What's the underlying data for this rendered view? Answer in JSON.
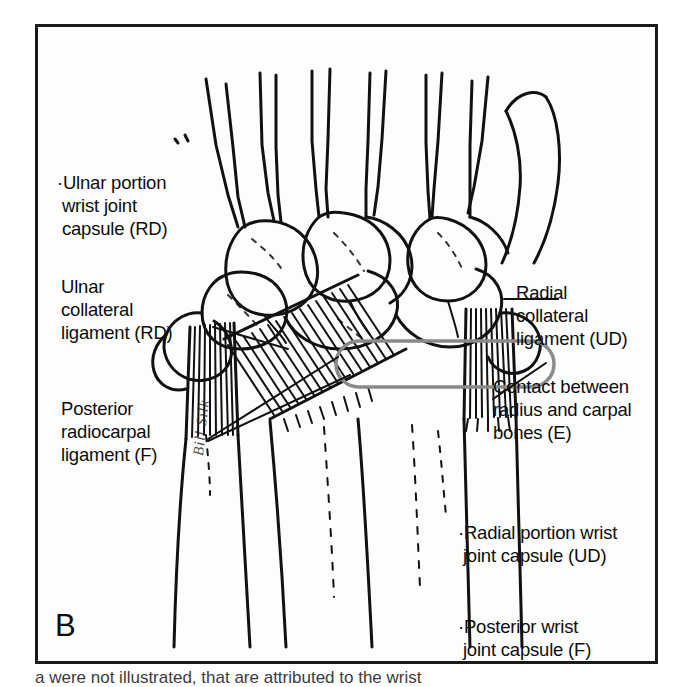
{
  "figure": {
    "panel_letter": "B",
    "artist_signature": "Bill Silk",
    "background_color": "#fdfdfd",
    "border_color": "#1a1a1a",
    "ink_color": "#111111",
    "highlight_color": "#8a8a8a"
  },
  "annotations": {
    "ulnar_capsule": {
      "line1": "·Ulnar portion",
      "line2": " wrist joint",
      "line3": " capsule (RD)",
      "full": "·Ulnar portion wrist joint capsule (RD)",
      "code": "RD"
    },
    "ulnar_ligament": {
      "line1": "Ulnar",
      "line2": "collateral",
      "line3": "ligament (RD)",
      "full": "Ulnar collateral ligament (RD)",
      "code": "RD"
    },
    "posterior_radiocarpal": {
      "line1": "Posterior",
      "line2": "radiocarpal",
      "line3": "ligament (F)",
      "full": "Posterior radiocarpal ligament (F)",
      "code": "F"
    },
    "radial_ligament": {
      "line1": "Radial",
      "line2": "collateral",
      "line3": "ligament (UD)",
      "full": "Radial collateral ligament (UD)",
      "code": "UD"
    },
    "contact_radius_carpal": {
      "line1": "Contact between",
      "line2": "radius and carpal",
      "line3": "bones (E)",
      "full": "Contact between radius and carpal bones (E)",
      "code": "E"
    },
    "radial_capsule": {
      "line1": "·Radial portion wrist",
      "line2": " joint capsule (UD)",
      "full": "·Radial portion wrist joint capsule (UD)",
      "code": "UD"
    },
    "posterior_capsule": {
      "line1": "·Posterior wrist",
      "line2": " joint capsule (F)",
      "full": "·Posterior wrist joint capsule (F)",
      "code": "F"
    }
  },
  "caption": {
    "clipped_line": "a were not illustrated, that are attributed to the wrist"
  },
  "artwork": {
    "subject": "posterior view of human wrist skeleton with ligaments",
    "elements": [
      "metacarpal-bones",
      "carpal-bones",
      "radius",
      "ulna",
      "ulnar-collateral-ligament",
      "radial-collateral-ligament",
      "posterior-radiocarpal-ligament",
      "contact-highlight-capsule"
    ]
  }
}
